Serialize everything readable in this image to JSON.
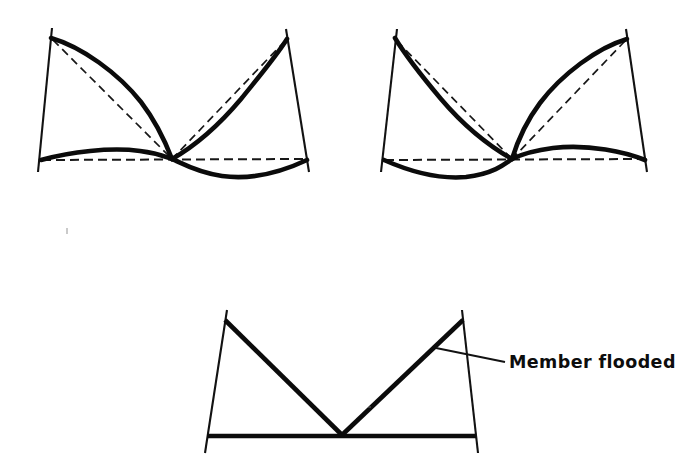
{
  "figure": {
    "background_color": "#ffffff",
    "line_color": "#0b0b0b",
    "dash_color": "#171717"
  },
  "callout": {
    "label": "Member flooded",
    "leader_from": [
      436,
      348
    ],
    "leader_to": [
      505,
      362
    ]
  },
  "panels": [
    {
      "name": "panel-left",
      "caption": "",
      "frame": {
        "top_left": [
          50,
          37
        ],
        "top_right": [
          287,
          38
        ],
        "bottom_left": [
          40,
          160
        ],
        "bottom_right": [
          307,
          160
        ],
        "apex": [
          172,
          159
        ],
        "leg_extension_bottom": 12,
        "leg_extension_top": 9
      },
      "undeformed": {
        "chord": [
          [
            40,
            160
          ],
          [
            307,
            160
          ]
        ],
        "left_diagonal": [
          [
            50,
            37
          ],
          [
            172,
            159
          ]
        ],
        "right_diagonal": [
          [
            287,
            38
          ],
          [
            172,
            159
          ]
        ]
      },
      "deformed": {
        "chord_left_bow": "up",
        "chord_right_bow": "down",
        "left_diagonal_bow": "right",
        "right_diagonal_bow": "right"
      }
    },
    {
      "name": "panel-right",
      "caption": "",
      "frame": {
        "top_left": [
          395,
          38
        ],
        "top_right": [
          627,
          38
        ],
        "bottom_left": [
          383,
          160
        ],
        "bottom_right": [
          645,
          160
        ],
        "apex": [
          512,
          159
        ],
        "leg_extension_bottom": 12,
        "leg_extension_top": 9
      },
      "undeformed": {
        "chord": [
          [
            383,
            160
          ],
          [
            645,
            160
          ]
        ],
        "left_diagonal": [
          [
            395,
            38
          ],
          [
            512,
            159
          ]
        ],
        "right_diagonal": [
          [
            627,
            38
          ],
          [
            512,
            159
          ]
        ]
      },
      "deformed": {
        "chord_left_bow": "down",
        "chord_right_bow": "up",
        "left_diagonal_bow": "left",
        "right_diagonal_bow": "left"
      }
    },
    {
      "name": "panel-bottom",
      "caption": "",
      "frame": {
        "top_left": [
          225,
          320
        ],
        "top_right": [
          463,
          320
        ],
        "bottom_left": [
          207,
          437
        ],
        "bottom_right": [
          476,
          437
        ],
        "apex": [
          342,
          435
        ],
        "leg_extension_bottom": 16,
        "leg_extension_top": 10
      },
      "undeformed": {
        "chord": [
          [
            207,
            437
          ],
          [
            476,
            437
          ]
        ],
        "left_diagonal": [
          [
            225,
            320
          ],
          [
            342,
            435
          ]
        ],
        "right_diagonal": [
          [
            463,
            320
          ],
          [
            342,
            435
          ]
        ]
      },
      "deformed": {
        "chord_left_bow": "none",
        "chord_right_bow": "none",
        "left_diagonal_bow": "none",
        "right_diagonal_bow": "none"
      }
    }
  ]
}
